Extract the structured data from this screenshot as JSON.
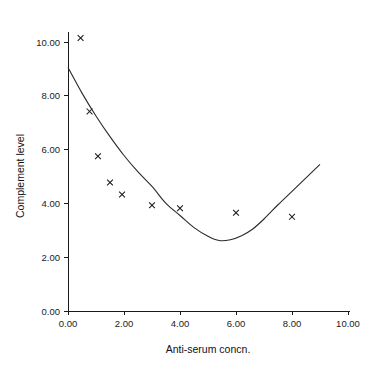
{
  "figure": {
    "background_color": "#ffffff",
    "ink_color": "#1a1a1a",
    "top_clipped_text": "",
    "width": 373,
    "height": 372
  },
  "chart_data": {
    "type": "scatter",
    "title": "",
    "subtitle": "",
    "xlabel": "Anti-serum concn.",
    "ylabel": "Complement level",
    "xlim": [
      0.0,
      10.0
    ],
    "ylim": [
      0.0,
      10.0
    ],
    "xticks": [
      0.0,
      2.0,
      4.0,
      6.0,
      8.0,
      10.0
    ],
    "yticks": [
      0.0,
      2.0,
      4.0,
      6.0,
      8.0,
      10.0
    ],
    "xtick_labels": [
      "0.00",
      "2.00",
      "4.00",
      "6.00",
      "8.00",
      "10.00"
    ],
    "ytick_labels": [
      "0.00",
      "2.00",
      "4.00",
      "6.00",
      "8.00",
      "10.00"
    ],
    "grid": false,
    "legend": false,
    "legend_position": "none",
    "marker": "x",
    "marker_color": "#1a1a1a",
    "curve_color": "#2a2a2a",
    "series": [
      {
        "name": "Observed complement level",
        "type": "scatter",
        "marker": "x",
        "points": [
          {
            "x": 0.45,
            "y": 10.15
          },
          {
            "x": 0.77,
            "y": 7.42
          },
          {
            "x": 1.07,
            "y": 5.75
          },
          {
            "x": 1.5,
            "y": 4.78
          },
          {
            "x": 1.93,
            "y": 4.33
          },
          {
            "x": 3.0,
            "y": 3.93
          },
          {
            "x": 4.0,
            "y": 3.82
          },
          {
            "x": 6.0,
            "y": 3.65
          },
          {
            "x": 8.0,
            "y": 3.5
          }
        ]
      },
      {
        "name": "Fitted quadratic curve",
        "type": "line",
        "x_range": [
          0.0,
          9.0
        ],
        "vertex": {
          "x": 5.4,
          "y": 2.62
        },
        "endpoints": [
          {
            "x": 0.0,
            "y": 9.05
          },
          {
            "x": 9.0,
            "y": 5.45
          }
        ],
        "points": [
          {
            "x": 0.0,
            "y": 9.05
          },
          {
            "x": 0.5,
            "y": 8.1
          },
          {
            "x": 1.0,
            "y": 7.25
          },
          {
            "x": 1.5,
            "y": 6.48
          },
          {
            "x": 2.0,
            "y": 5.78
          },
          {
            "x": 2.5,
            "y": 5.17
          },
          {
            "x": 3.0,
            "y": 4.63
          },
          {
            "x": 3.5,
            "y": 4.0
          },
          {
            "x": 4.0,
            "y": 3.55
          },
          {
            "x": 4.5,
            "y": 3.1
          },
          {
            "x": 5.0,
            "y": 2.78
          },
          {
            "x": 5.4,
            "y": 2.62
          },
          {
            "x": 5.8,
            "y": 2.65
          },
          {
            "x": 6.2,
            "y": 2.8
          },
          {
            "x": 6.6,
            "y": 3.05
          },
          {
            "x": 7.0,
            "y": 3.42
          },
          {
            "x": 7.5,
            "y": 3.95
          },
          {
            "x": 8.0,
            "y": 4.45
          },
          {
            "x": 8.5,
            "y": 4.95
          },
          {
            "x": 9.0,
            "y": 5.45
          }
        ]
      }
    ]
  }
}
